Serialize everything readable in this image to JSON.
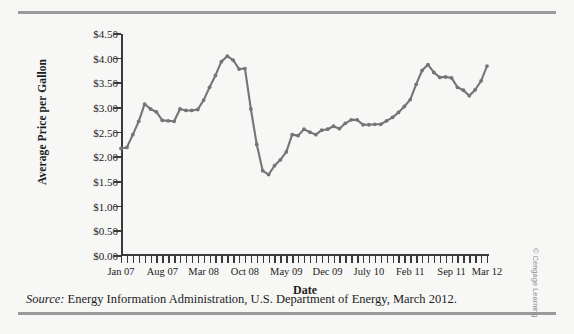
{
  "figure": {
    "source_label": "Source:",
    "source_text": " Energy Information Administration, U.S. Department of Energy, March 2012.",
    "credit": "© Cengage Learning",
    "line_color": "#757575",
    "axis_color": "#3a3a3a",
    "background": "#f7f7f5"
  },
  "chart_data": {
    "type": "line",
    "title": "",
    "xlabel": "Date",
    "ylabel": "Average Price per Gallon",
    "ylim": [
      0.0,
      4.5
    ],
    "ytick_values": [
      0.0,
      0.5,
      1.0,
      1.5,
      2.0,
      2.5,
      3.0,
      3.5,
      4.0,
      4.5
    ],
    "ytick_labels": [
      "$0.00",
      "$0.50",
      "$1.00",
      "$1.50",
      "$2.00",
      "$2.50",
      "$3.00",
      "$3.50",
      "$4.00",
      "$4.50"
    ],
    "grid": false,
    "legend": false,
    "marker": "circle",
    "x_start": "Jan 07",
    "x_end": "Mar 12",
    "x_tick_count": 63,
    "xtick_labels": [
      {
        "label": "Jan 07",
        "index": 0
      },
      {
        "label": "Aug 07",
        "index": 7
      },
      {
        "label": "Mar 08",
        "index": 14
      },
      {
        "label": "Oct 08",
        "index": 21
      },
      {
        "label": "May 09",
        "index": 28
      },
      {
        "label": "Dec 09",
        "index": 35
      },
      {
        "label": "July 10",
        "index": 42
      },
      {
        "label": "Feb 11",
        "index": 49
      },
      {
        "label": "Sep 11",
        "index": 56
      },
      {
        "label": "Mar 12",
        "index": 62
      }
    ],
    "categories": [
      "Jan 07",
      "Feb 07",
      "Mar 07",
      "Apr 07",
      "May 07",
      "Jun 07",
      "Jul 07",
      "Aug 07",
      "Sep 07",
      "Oct 07",
      "Nov 07",
      "Dec 07",
      "Jan 08",
      "Feb 08",
      "Mar 08",
      "Apr 08",
      "May 08",
      "Jun 08",
      "Jul 08",
      "Aug 08",
      "Sep 08",
      "Oct 08",
      "Nov 08",
      "Dec 08",
      "Jan 09",
      "Feb 09",
      "Mar 09",
      "Apr 09",
      "May 09",
      "Jun 09",
      "Jul 09",
      "Aug 09",
      "Sep 09",
      "Oct 09",
      "Nov 09",
      "Dec 09",
      "Jan 10",
      "Feb 10",
      "Mar 10",
      "Apr 10",
      "May 10",
      "Jun 10",
      "Jul 10",
      "Aug 10",
      "Sep 10",
      "Oct 10",
      "Nov 10",
      "Dec 10",
      "Jan 11",
      "Feb 11",
      "Mar 11",
      "Apr 11",
      "May 11",
      "Jun 11",
      "Jul 11",
      "Aug 11",
      "Sep 11",
      "Oct 11",
      "Nov 11",
      "Dec 11",
      "Jan 12",
      "Feb 12",
      "Mar 12"
    ],
    "values": [
      2.18,
      2.2,
      2.46,
      2.73,
      3.08,
      2.98,
      2.92,
      2.75,
      2.74,
      2.73,
      2.98,
      2.95,
      2.95,
      2.97,
      3.16,
      3.42,
      3.66,
      3.94,
      4.05,
      3.97,
      3.79,
      3.8,
      2.98,
      2.26,
      1.73,
      1.65,
      1.83,
      1.95,
      2.11,
      2.46,
      2.44,
      2.57,
      2.51,
      2.46,
      2.55,
      2.57,
      2.63,
      2.58,
      2.69,
      2.76,
      2.76,
      2.66,
      2.66,
      2.67,
      2.67,
      2.74,
      2.81,
      2.91,
      3.03,
      3.17,
      3.48,
      3.76,
      3.88,
      3.72,
      3.62,
      3.63,
      3.61,
      3.42,
      3.36,
      3.25,
      3.37,
      3.55,
      3.85
    ]
  }
}
